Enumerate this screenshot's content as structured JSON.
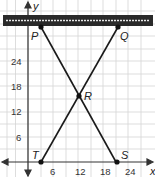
{
  "diagram": {
    "axes": {
      "x_label": "x",
      "y_label": "y"
    },
    "x_ticks": [
      "6",
      "12",
      "18",
      "24"
    ],
    "y_ticks": [
      "6",
      "12",
      "18",
      "24"
    ],
    "points": {
      "P": {
        "label": "P",
        "x": 3,
        "y": 32
      },
      "Q": {
        "label": "Q",
        "x": 21,
        "y": 32
      },
      "R": {
        "label": "R",
        "x": 12,
        "y": 16
      },
      "S": {
        "label": "S",
        "x": 21,
        "y": 0
      },
      "T": {
        "label": "T",
        "x": 3,
        "y": 0
      }
    },
    "segments": [
      [
        "P",
        "S"
      ],
      [
        "Q",
        "T"
      ]
    ],
    "top_bar": {
      "color": "#2a2a2a",
      "stripe_color": "#e8e8e8"
    },
    "grid_color": "#d0d0d0",
    "line_color": "#1a1a1a"
  }
}
